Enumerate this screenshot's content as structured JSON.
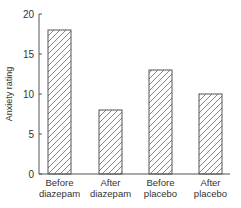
{
  "chart_data": {
    "type": "bar",
    "title": "",
    "xlabel": "",
    "ylabel": "Anxiety rating",
    "ylim": [
      0,
      20
    ],
    "yticks": [
      0,
      5,
      10,
      15,
      20
    ],
    "grid": false,
    "legend": null,
    "categories": [
      [
        "Before",
        "diazepam"
      ],
      [
        "After",
        "diazepam"
      ],
      [
        "Before",
        "placebo"
      ],
      [
        "After",
        "placebo"
      ]
    ],
    "category_labels": [
      "Before diazepam",
      "After diazepam",
      "Before placebo",
      "After placebo"
    ],
    "values": [
      18,
      8,
      13,
      10
    ],
    "bar_fill": "hatched",
    "colors": {
      "axis": "#555555",
      "bar_stroke": "#555555",
      "hatch": "#666666",
      "text": "#333333"
    }
  }
}
